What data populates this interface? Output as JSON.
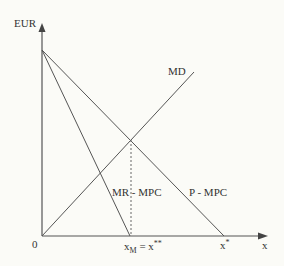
{
  "diagram": {
    "y_axis_label": "EUR",
    "x_axis_label": "x",
    "origin_label": "0",
    "curves": [
      {
        "id": "md",
        "label": "MD",
        "description": "marginal damage, upward sloping from origin"
      },
      {
        "id": "mr_mpc",
        "label": "MR - MPC",
        "description": "steep downward line from y-intercept to x_M"
      },
      {
        "id": "p_mpc",
        "label": "P - MPC",
        "description": "downward line from y-intercept to x*"
      }
    ],
    "x_ticks": {
      "xm": {
        "main": "x",
        "sub": "M",
        "eq": " = x",
        "sup": "**"
      },
      "xstar": {
        "main": "x",
        "sup": "*"
      }
    },
    "colors": {
      "line": "#444444",
      "background": "#fbfbf7"
    }
  }
}
